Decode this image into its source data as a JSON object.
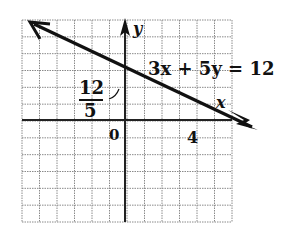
{
  "diagram": {
    "equation": "3x + 5y = 12",
    "x_axis_label": "x",
    "y_axis_label": "y",
    "origin_label": "0",
    "x_intercept_label": "4",
    "y_intercept_numerator": "12",
    "y_intercept_denominator": "5",
    "x_range": [
      -6,
      6
    ],
    "y_range": [
      -6,
      6
    ],
    "grid_step": 1,
    "line": {
      "slope": -0.6,
      "y_intercept": 2.4,
      "x_intercept": 4,
      "from": [
        -5.5,
        5.7
      ],
      "to": [
        6.1,
        -1.26
      ]
    },
    "colors": {
      "line": "#111111",
      "axes": "#222222",
      "grid": "#8a8a8a",
      "background": "#ffffff"
    }
  }
}
